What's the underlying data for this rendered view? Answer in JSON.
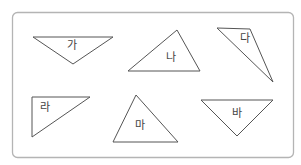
{
  "figure": {
    "frame": {
      "x": 12.5,
      "y": 12.5,
      "width": 281,
      "height": 145,
      "radius": 5,
      "stroke": "#b4b4b4"
    },
    "stroke_color": "#555555",
    "label_color": "#444444",
    "triangles": [
      {
        "label": "가",
        "points": "33,37 113,37 73,64",
        "label_x": 72,
        "label_y": 49
      },
      {
        "label": "나",
        "points": "177,30 128,71 200,71",
        "label_x": 171,
        "label_y": 61
      },
      {
        "label": "다",
        "points": "217,28 250,29 273,82",
        "label_x": 245,
        "label_y": 42
      },
      {
        "label": "라",
        "points": "32,97 90,97 32,137",
        "label_x": 45,
        "label_y": 111
      },
      {
        "label": "마",
        "points": "136,95 113,142 178,142",
        "label_x": 140,
        "label_y": 129
      },
      {
        "label": "바",
        "points": "201,100 273,100 237,136",
        "label_x": 237,
        "label_y": 117
      }
    ]
  }
}
